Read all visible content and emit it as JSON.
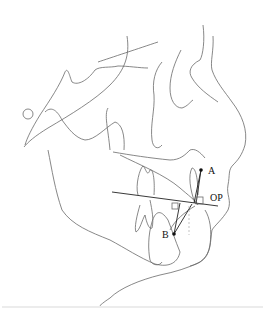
{
  "figure": {
    "type": "cephalometric tracing",
    "labels": {
      "point_a": "A",
      "point_b": "B",
      "occlusal_plane": "OP"
    }
  }
}
